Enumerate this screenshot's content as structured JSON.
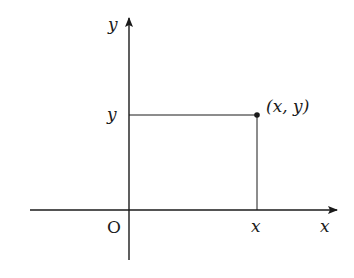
{
  "diagram": {
    "type": "coordinate-plane",
    "axes": {
      "x_label": "x",
      "y_label": "y",
      "origin_label": "O"
    },
    "point": {
      "label": "(x, y)",
      "x_tick_label": "x",
      "y_tick_label": "y"
    },
    "colors": {
      "line": "#1a1a1a",
      "background": "#ffffff"
    }
  }
}
